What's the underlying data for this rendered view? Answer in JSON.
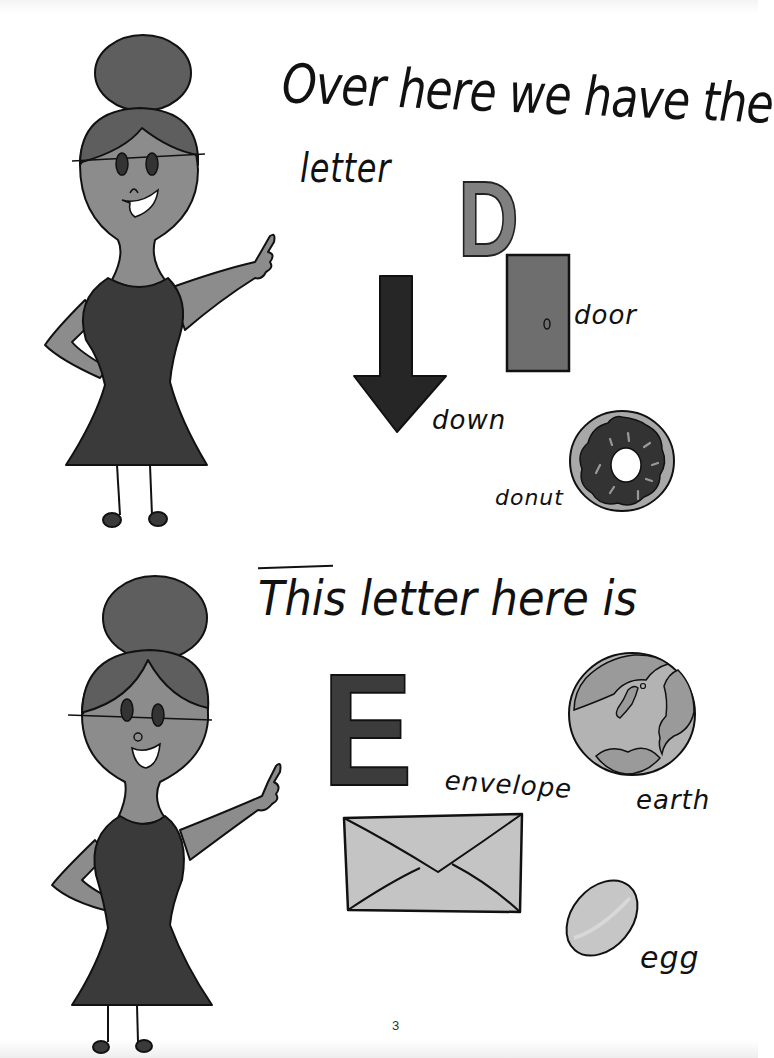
{
  "page": {
    "page_number": "3",
    "colors": {
      "skin": "#8c8c8c",
      "hair": "#5e5e5e",
      "dress": "#3a3a3a",
      "outline": "#111111",
      "door": "#6e6e6e",
      "donut_icing": "#333333",
      "donut_dough": "#a8a8a8",
      "envelope": "#c4c4c4",
      "earth_land": "#9a9a9a",
      "earth_sea": "#b3b3b3",
      "egg": "#c6c6c6"
    }
  },
  "panel_d": {
    "sentence": "Over here we have the",
    "sentence_cont": "letter",
    "letter": "D",
    "items": [
      {
        "word": "door",
        "icon": "door-icon"
      },
      {
        "word": "down",
        "icon": "down-arrow-icon"
      },
      {
        "word": "donut",
        "icon": "donut-icon"
      }
    ]
  },
  "panel_e": {
    "sentence": "This letter here is",
    "letter": "E",
    "items": [
      {
        "word": "envelope",
        "icon": "envelope-icon"
      },
      {
        "word": "earth",
        "icon": "earth-icon"
      },
      {
        "word": "egg",
        "icon": "egg-icon"
      }
    ]
  }
}
